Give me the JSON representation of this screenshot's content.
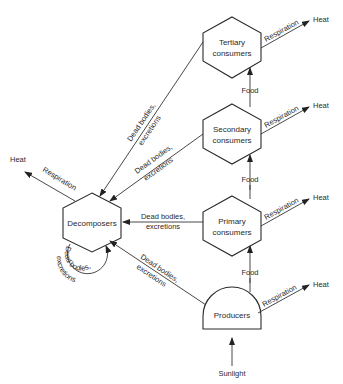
{
  "nodes": {
    "tertiary": {
      "line1": "Tertiary",
      "line2": "consumers"
    },
    "secondary": {
      "line1": "Secondary",
      "line2": "consumers"
    },
    "primary": {
      "line1": "Primary",
      "line2": "consumers"
    },
    "producers": {
      "label": "Producers"
    },
    "decomposers": {
      "label": "Decomposers"
    }
  },
  "labels": {
    "heat": "Heat",
    "respiration": "Respiration",
    "food": "Food",
    "sunlight": "Sunlight",
    "dead_bodies": "Dead bodies,",
    "excretions": "excretions",
    "loop_dead_bodies": "Dead bodies,",
    "loop_excretions": "excretions"
  }
}
